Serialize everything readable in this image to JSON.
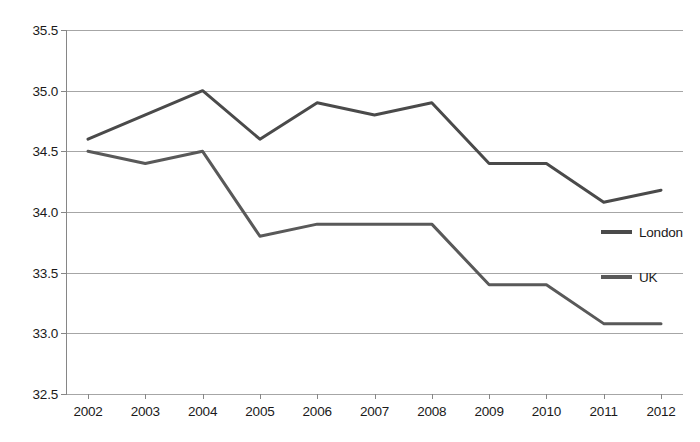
{
  "chart_data": {
    "type": "line",
    "title": "",
    "subtitle": "",
    "xlabel": "",
    "ylabel": "",
    "categories": [
      "2002",
      "2003",
      "2004",
      "2005",
      "2006",
      "2007",
      "2008",
      "2009",
      "2010",
      "2011",
      "2012"
    ],
    "series": [
      {
        "name": "London",
        "color": "#4a4a4a",
        "values": [
          34.6,
          34.8,
          35.0,
          34.6,
          34.9,
          34.8,
          34.9,
          34.4,
          34.4,
          34.08,
          34.18
        ]
      },
      {
        "name": "UK",
        "color": "#595959",
        "values": [
          34.5,
          34.4,
          34.5,
          33.8,
          33.9,
          33.9,
          33.9,
          33.4,
          33.4,
          33.08,
          33.08
        ]
      }
    ],
    "ylim": [
      32.5,
      35.5
    ],
    "yticks": [
      "32.5",
      "33.0",
      "33.5",
      "34.0",
      "34.5",
      "35.0",
      "35.5"
    ],
    "ytick_values": [
      32.5,
      33.0,
      33.5,
      34.0,
      34.5,
      35.0,
      35.5
    ],
    "grid": true,
    "grid_axis": "y",
    "legend_position": "right",
    "legend_entries": [
      "London",
      "UK"
    ]
  },
  "axes": {
    "y_tick_labels": [
      "35.5",
      "35.0",
      "34.5",
      "34.0",
      "33.5",
      "33.0",
      "32.5"
    ],
    "x_tick_labels": [
      "2002",
      "2003",
      "2004",
      "2005",
      "2006",
      "2007",
      "2008",
      "2009",
      "2010",
      "2011",
      "2012"
    ]
  },
  "legend": {
    "items": [
      {
        "label": "London",
        "color": "#4a4a4a"
      },
      {
        "label": "UK",
        "color": "#595959"
      }
    ]
  },
  "colors": {
    "london": "#4a4a4a",
    "uk": "#595959",
    "gridline": "#a6a6a6",
    "axis": "#868686",
    "text": "#1a1a1a",
    "background": "#ffffff"
  }
}
